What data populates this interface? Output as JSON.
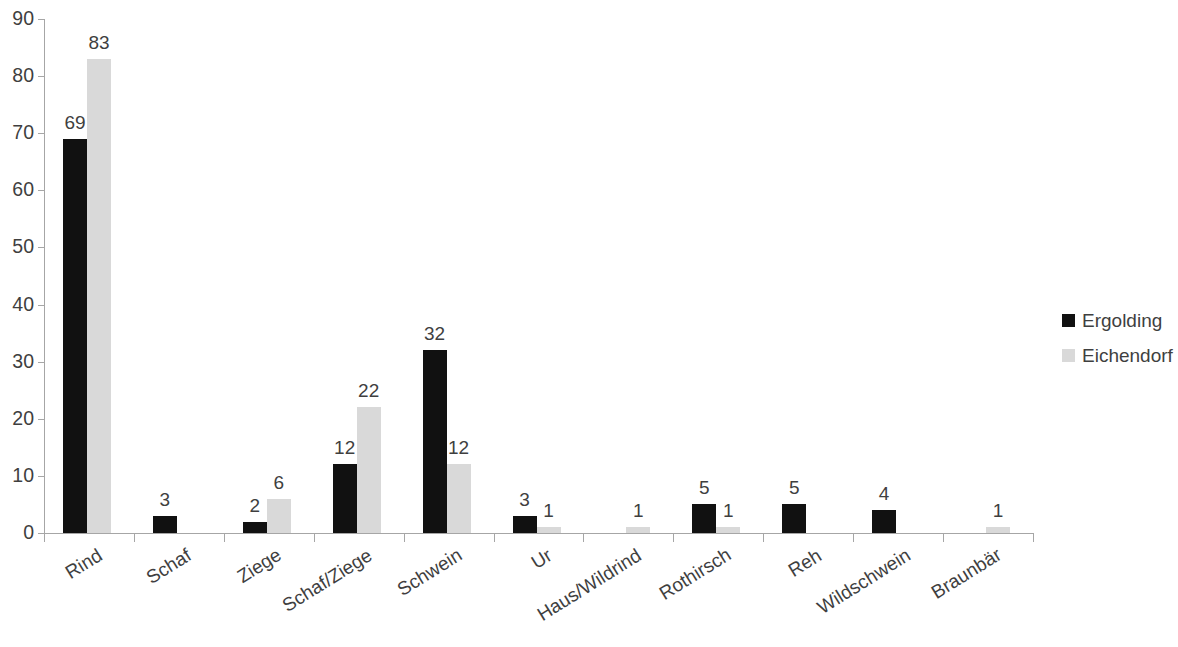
{
  "chart_data": {
    "type": "bar",
    "title": "",
    "subtitle": "",
    "xlabel": "",
    "ylabel": "",
    "ylim": [
      0,
      90
    ],
    "ytick_step": 10,
    "yticks": [
      "0",
      "10",
      "20",
      "30",
      "40",
      "50",
      "60",
      "70",
      "80",
      "90"
    ],
    "grid": false,
    "legend_position": "right",
    "categories": [
      "Rind",
      "Schaf",
      "Ziege",
      "Schaf/Ziege",
      "Schwein",
      "Ur",
      "Haus/Wildrind",
      "Rothirsch",
      "Reh",
      "Wildschwein",
      "Braunbär"
    ],
    "series": [
      {
        "name": "Ergolding",
        "color": "#111111",
        "values": [
          69,
          3,
          2,
          12,
          32,
          3,
          null,
          5,
          5,
          4,
          null
        ],
        "labels": [
          "69",
          "3",
          "2",
          "12",
          "32",
          "3",
          "",
          "5",
          "5",
          "4",
          ""
        ]
      },
      {
        "name": "Eichendorf",
        "color": "#d9d9d9",
        "values": [
          83,
          null,
          6,
          22,
          12,
          1,
          1,
          1,
          null,
          null,
          1
        ],
        "labels": [
          "83",
          "",
          "6",
          "22",
          "12",
          "1",
          "1",
          "1",
          "",
          "",
          "1"
        ]
      }
    ]
  }
}
